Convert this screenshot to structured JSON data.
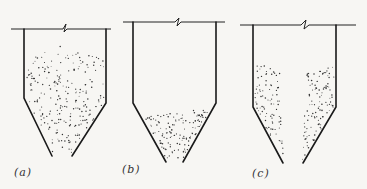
{
  "figure": {
    "panels": [
      {
        "id": "a",
        "label": "(a)",
        "description": "hopper with material filling the whole bin in a dome shape (mass flow)"
      },
      {
        "id": "b",
        "label": "(b)",
        "description": "hopper with material only remaining in the conical bottom"
      },
      {
        "id": "c",
        "label": "(c)",
        "description": "hopper with funnel (core) flow: material on walls, empty central channel"
      }
    ]
  },
  "colors": {
    "line": "#1a1a1a",
    "background": "#f7f6f3",
    "particles": "#333333"
  }
}
